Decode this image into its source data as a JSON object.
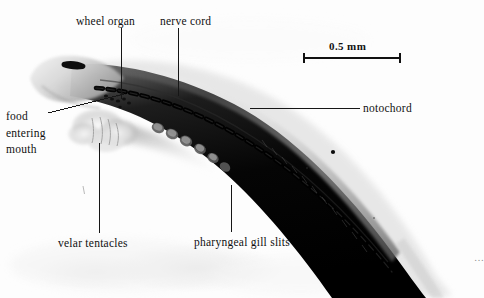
{
  "figure": {
    "kind": "photomicrograph",
    "background_color": "#fdfdfd",
    "ink_color": "#161616",
    "specimen_color": "#0a0a0a"
  },
  "scale_bar": {
    "label": "0.5 mm",
    "x_start": 304,
    "x_end": 400,
    "y": 58
  },
  "labels": [
    {
      "id": "wheel-organ",
      "text": "wheel organ",
      "x": 76,
      "y": 14
    },
    {
      "id": "nerve-cord",
      "text": "nerve cord",
      "x": 160,
      "y": 14
    },
    {
      "id": "notochord",
      "text": "notochord",
      "x": 363,
      "y": 101
    },
    {
      "id": "food-entering-mouth",
      "text": "food entering mouth",
      "x": 6,
      "y": 108
    },
    {
      "id": "velar-tentacles",
      "text": "velar tentacles",
      "x": 58,
      "y": 236
    },
    {
      "id": "pharyngeal-gill-slits",
      "text": "pharyngeal gill slits",
      "x": 194,
      "y": 235
    }
  ],
  "edge_caption": {
    "visible": true,
    "text": "…",
    "note": "clipped at right margin"
  }
}
